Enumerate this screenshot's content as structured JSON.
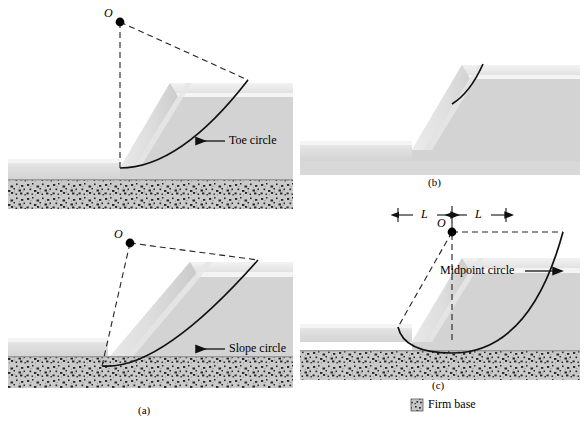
{
  "figure": {
    "background": "#ffffff",
    "panels": [
      {
        "id": "panel-toe",
        "caption": "",
        "callout": {
          "label": "Toe circle",
          "arrow": "left"
        },
        "point_label": "O",
        "circle_type": "toe circle"
      },
      {
        "id": "panel-b",
        "caption": "(b)",
        "callout": {
          "label": "",
          "arrow": "none"
        },
        "point_label": "",
        "circle_type": "slope circle"
      },
      {
        "id": "panel-a",
        "caption": "(a)",
        "callout": {
          "label": "Slope circle",
          "arrow": "left"
        },
        "point_label": "O",
        "circle_type": "slope circle"
      },
      {
        "id": "panel-c",
        "caption": "(c)",
        "callout": {
          "label": "Midpoint circle",
          "arrow": "right"
        },
        "point_label": "O",
        "circle_type": "midpoint circle",
        "dimensions": [
          {
            "label": "L"
          },
          {
            "label": "L"
          }
        ]
      }
    ],
    "legend": {
      "swatch": "firm-base-hatch",
      "label": "Firm base"
    },
    "colors": {
      "line": "#1a1a1a",
      "embankment_body": "#d2d2d2",
      "embankment_top": "#efefef",
      "embankment_face_light": "#e8e8e8",
      "embankment_face_dark": "#c4c4c4",
      "ground_band": "#e4e4e4",
      "firm_base": "#c9c9c9",
      "firm_base_speckle": "#2b2b2b",
      "background": "#ffffff"
    }
  }
}
